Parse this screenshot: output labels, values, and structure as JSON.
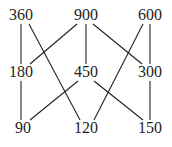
{
  "diagram": {
    "type": "factor-lattice",
    "nodes": [
      {
        "id": "n360",
        "label": "360",
        "x": 21,
        "y": 20
      },
      {
        "id": "n900",
        "label": "900",
        "x": 86,
        "y": 20
      },
      {
        "id": "n600",
        "label": "600",
        "x": 150,
        "y": 20
      },
      {
        "id": "n180",
        "label": "180",
        "x": 21,
        "y": 77
      },
      {
        "id": "n450",
        "label": "450",
        "x": 86,
        "y": 77
      },
      {
        "id": "n300",
        "label": "300",
        "x": 150,
        "y": 77
      },
      {
        "id": "n90",
        "label": "90",
        "x": 23,
        "y": 133
      },
      {
        "id": "n120",
        "label": "120",
        "x": 86,
        "y": 133
      },
      {
        "id": "n150",
        "label": "150",
        "x": 150,
        "y": 133
      }
    ],
    "edges": [
      {
        "from": "360",
        "to": "180",
        "x1": 21,
        "y1": 24,
        "x2": 21,
        "y2": 64
      },
      {
        "from": "360",
        "to": "120",
        "x1": 29,
        "y1": 24,
        "x2": 80,
        "y2": 120
      },
      {
        "from": "900",
        "to": "180",
        "x1": 77,
        "y1": 24,
        "x2": 30,
        "y2": 64
      },
      {
        "from": "900",
        "to": "450",
        "x1": 86,
        "y1": 24,
        "x2": 86,
        "y2": 64
      },
      {
        "from": "900",
        "to": "300",
        "x1": 93,
        "y1": 24,
        "x2": 142,
        "y2": 64
      },
      {
        "from": "600",
        "to": "120",
        "x1": 143,
        "y1": 24,
        "x2": 94,
        "y2": 120
      },
      {
        "from": "600",
        "to": "300",
        "x1": 150,
        "y1": 24,
        "x2": 150,
        "y2": 64
      },
      {
        "from": "180",
        "to": "90",
        "x1": 21,
        "y1": 81,
        "x2": 21,
        "y2": 120
      },
      {
        "from": "450",
        "to": "90",
        "x1": 78,
        "y1": 81,
        "x2": 30,
        "y2": 120
      },
      {
        "from": "450",
        "to": "150",
        "x1": 94,
        "y1": 81,
        "x2": 143,
        "y2": 120
      },
      {
        "from": "300",
        "to": "150",
        "x1": 150,
        "y1": 81,
        "x2": 150,
        "y2": 120
      }
    ]
  }
}
